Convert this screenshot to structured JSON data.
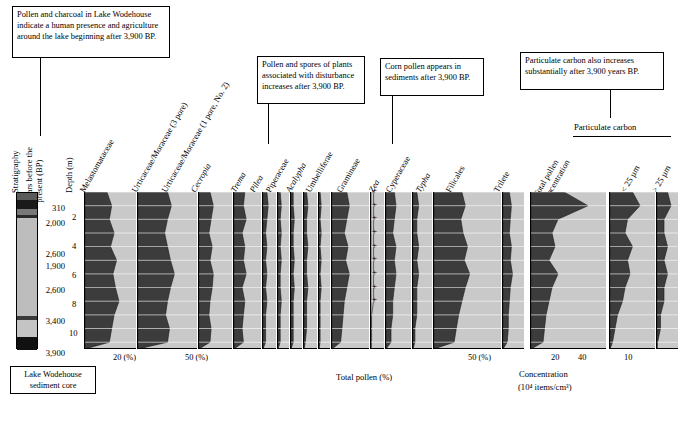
{
  "figure": {
    "bottom_axis_label": "Total pollen (%)",
    "concentration_label_line1": "Concentration",
    "concentration_label_line2": "(10⁴ items/cm³)",
    "particulate_carbon_label": "Particulate carbon",
    "total_pollen_conc_label": "Total pollen\nconcentration"
  },
  "callouts": [
    {
      "id": "callout-1",
      "text": "Pollen and charcoal in Lake Wodehouse indicate a human presence and agriculture around the lake beginning after 3,900 BP."
    },
    {
      "id": "callout-2",
      "text": "Pollen and spores of plants associated with disturbance increases after 3,900 BP."
    },
    {
      "id": "callout-3",
      "text": "Corn pollen appears in sediments after 3,900 BP."
    },
    {
      "id": "callout-4",
      "text": "Particulate carbon also increases substantially after 3,900 years BP."
    }
  ],
  "axes": {
    "stratigraphy_label": "Stratigraphy",
    "years_label": "Years before the present (BP)",
    "depth_label": "Depth (m)",
    "depth_ticks": [
      "2",
      "4",
      "6",
      "8",
      "10"
    ],
    "year_ticks": [
      "310",
      "2,000",
      "2,600",
      "1,900",
      "2,600",
      "3,400",
      "3,900"
    ],
    "legend_caption": "Lake Wodehouse sediment core"
  },
  "taxa": [
    {
      "name": "Melastomataceae",
      "italic": false
    },
    {
      "name": "Urticaceae/Moraceae (3 pore)",
      "italic": false
    },
    {
      "name": "Urticaceae/Moraceae (1 pore, No. 2)",
      "italic": false
    },
    {
      "name": "Cecropia",
      "italic": true
    },
    {
      "name": "Trema",
      "italic": true
    },
    {
      "name": "Pilea",
      "italic": true
    },
    {
      "name": "Piperaceae",
      "italic": false
    },
    {
      "name": "Acalypha",
      "italic": true
    },
    {
      "name": "Umbelliferae",
      "italic": false
    },
    {
      "name": "Gramineae",
      "italic": false
    },
    {
      "name": "Zea",
      "italic": true
    },
    {
      "name": "Cyperaceae",
      "italic": false
    },
    {
      "name": "Typha",
      "italic": true
    },
    {
      "name": "Filicales",
      "italic": false
    },
    {
      "name": "Trilete",
      "italic": false
    },
    {
      "name": "Total pollen concentration",
      "italic": false
    },
    {
      "name": "< 25 µm",
      "italic": false
    },
    {
      "name": "> 25 µm",
      "italic": false
    }
  ],
  "scale_ticks": {
    "melastomataceae": [
      "20 (%)"
    ],
    "urticaceae3": [
      "50 (%)"
    ],
    "filicales": [
      "50 (%)"
    ],
    "concentration": [
      "20",
      "40"
    ],
    "carbon": [
      "10"
    ]
  },
  "chart_data": {
    "type": "area",
    "xlabel": "Total pollen (%)",
    "ylabel": "Depth (m)",
    "ylim": [
      0,
      11.5
    ],
    "grid": false,
    "orientation": "vertical-depth",
    "depth_axis_m": [
      0,
      1,
      2,
      3,
      4,
      5,
      6,
      7,
      8,
      9,
      10,
      11
    ],
    "age_control": [
      {
        "depth_m": 0.6,
        "age_bp": "310"
      },
      {
        "depth_m": 1.9,
        "age_bp": "2,000"
      },
      {
        "depth_m": 3.6,
        "age_bp": "2,600"
      },
      {
        "depth_m": 4.4,
        "age_bp": "1,900"
      },
      {
        "depth_m": 6.1,
        "age_bp": "2,600"
      },
      {
        "depth_m": 8.2,
        "age_bp": "3,400"
      },
      {
        "depth_m": 10.5,
        "age_bp": "3,900"
      }
    ],
    "series": [
      {
        "name": "Melastomataceae",
        "units": "%",
        "xmax": 42,
        "values": [
          18,
          22,
          20,
          24,
          21,
          26,
          23,
          25,
          28,
          24,
          22,
          20
        ]
      },
      {
        "name": "Urticaceae/Moraceae (3 pore)",
        "units": "%",
        "xmax": 60,
        "values": [
          30,
          34,
          30,
          27,
          30,
          33,
          37,
          33,
          30,
          28,
          32,
          30
        ]
      },
      {
        "name": "Urticaceae/Moraceae (1 pore, No. 2)",
        "units": "%",
        "xmax": 30,
        "values": [
          10,
          13,
          11,
          9,
          12,
          10,
          13,
          12,
          10,
          9,
          11,
          10
        ]
      },
      {
        "name": "Cecropia",
        "units": "%",
        "xmax": 20,
        "values": [
          8,
          7,
          9,
          6,
          8,
          7,
          9,
          6,
          8,
          7,
          6,
          7
        ]
      },
      {
        "name": "Trema",
        "units": "%",
        "xmax": 10,
        "values": [
          3,
          4,
          3,
          2,
          3,
          2,
          3,
          2,
          3,
          2,
          2,
          2
        ]
      },
      {
        "name": "Pilea",
        "units": "%",
        "xmax": 10,
        "values": [
          2,
          3,
          2,
          3,
          2,
          3,
          2,
          2,
          3,
          2,
          2,
          2
        ]
      },
      {
        "name": "Piperaceae",
        "units": "%",
        "xmax": 10,
        "values": [
          2,
          2,
          3,
          2,
          2,
          3,
          2,
          3,
          2,
          2,
          2,
          2
        ]
      },
      {
        "name": "Acalypha",
        "units": "%",
        "xmax": 10,
        "values": [
          2,
          3,
          2,
          2,
          3,
          2,
          2,
          3,
          2,
          2,
          2,
          1
        ]
      },
      {
        "name": "Umbelliferae",
        "units": "%",
        "xmax": 10,
        "values": [
          1,
          2,
          1,
          2,
          1,
          2,
          1,
          2,
          1,
          1,
          1,
          1
        ]
      },
      {
        "name": "Gramineae",
        "units": "%",
        "xmax": 30,
        "values": [
          12,
          14,
          12,
          10,
          13,
          11,
          14,
          12,
          10,
          9,
          8,
          7
        ]
      },
      {
        "name": "Zea",
        "units": "%",
        "xmax": 5,
        "marker": "cross",
        "values": [
          1,
          1,
          1,
          1,
          1,
          1,
          1,
          1,
          1,
          0,
          0,
          0
        ]
      },
      {
        "name": "Cyperaceae",
        "units": "%",
        "xmax": 15,
        "values": [
          5,
          6,
          5,
          4,
          6,
          5,
          6,
          5,
          4,
          4,
          3,
          3
        ]
      },
      {
        "name": "Typha",
        "units": "%",
        "xmax": 10,
        "values": [
          2,
          3,
          2,
          2,
          3,
          2,
          3,
          2,
          2,
          2,
          1,
          1
        ]
      },
      {
        "name": "Filicales",
        "units": "%",
        "xmax": 60,
        "values": [
          25,
          28,
          24,
          26,
          30,
          27,
          32,
          28,
          25,
          22,
          20,
          18
        ]
      },
      {
        "name": "Trilete",
        "units": "%",
        "xmax": 20,
        "values": [
          6,
          8,
          7,
          6,
          8,
          7,
          9,
          7,
          6,
          5,
          5,
          4
        ]
      },
      {
        "name": "Total pollen concentration",
        "units": "10⁴ items/cm³",
        "xmax": 50,
        "values": [
          22,
          38,
          18,
          14,
          16,
          12,
          18,
          14,
          12,
          10,
          9,
          8
        ]
      },
      {
        "name": "Particulate carbon < 25 µm",
        "units": "10⁴ items/cm³",
        "xmax": 18,
        "values": [
          9,
          12,
          7,
          6,
          9,
          7,
          8,
          6,
          5,
          3,
          2,
          1
        ]
      },
      {
        "name": "Particulate carbon > 25 µm",
        "units": "10⁴ items/cm³",
        "xmax": 6,
        "values": [
          3,
          4,
          2,
          2,
          3,
          2,
          3,
          2,
          2,
          1,
          1,
          0
        ]
      }
    ]
  }
}
